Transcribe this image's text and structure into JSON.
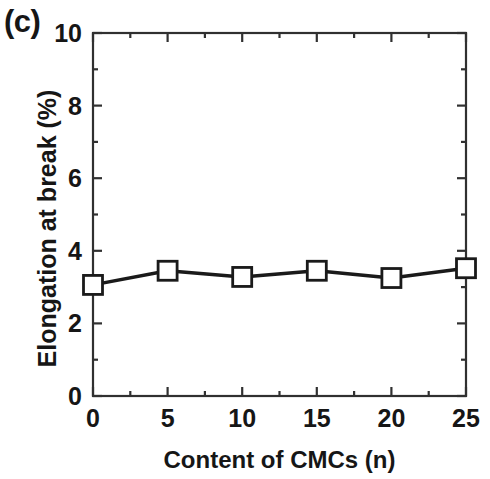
{
  "panel": {
    "label": "(c)"
  },
  "chart_data": {
    "type": "line",
    "title": "",
    "subtitle": "",
    "panel_label": "(c)",
    "xlabel": "Content of CMCs (n)",
    "ylabel": "Elongation at break (%)",
    "xlim": [
      0,
      25
    ],
    "ylim": [
      0,
      10
    ],
    "grid": false,
    "legend": false,
    "legend_position": "none",
    "frame": "box",
    "tick_direction": "in",
    "x_major_ticks": [
      0,
      5,
      10,
      15,
      20,
      25
    ],
    "x_major_tick_labels": [
      "0",
      "5",
      "10",
      "15",
      "20",
      "25"
    ],
    "x_minor_ticks": [
      2.5,
      7.5,
      12.5,
      17.5,
      22.5
    ],
    "y_major_ticks": [
      0,
      2,
      4,
      6,
      8,
      10
    ],
    "y_major_tick_labels": [
      "0",
      "2",
      "4",
      "6",
      "8",
      "10"
    ],
    "y_minor_ticks": [
      1,
      3,
      5,
      7,
      9
    ],
    "series": [
      {
        "name": "Elongation at break",
        "marker": "open-square",
        "marker_color": "#ffffff",
        "marker_edge_color": "#1a1a1a",
        "line_color": "#1a1a1a",
        "line_style": "solid",
        "x": [
          0,
          5,
          10,
          15,
          20,
          25
        ],
        "values": [
          3.06,
          3.45,
          3.28,
          3.45,
          3.25,
          3.52
        ]
      }
    ]
  },
  "colors": {
    "axis": "#303030",
    "line": "#1a1a1a",
    "text": "#161616",
    "background": "#ffffff"
  }
}
